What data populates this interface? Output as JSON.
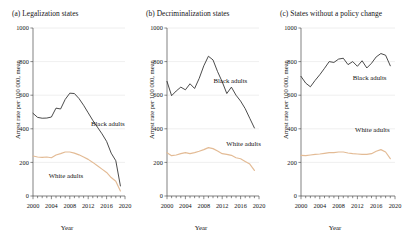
{
  "figure": {
    "xlabel": "Year",
    "ylabel": "Arrest rate per 100 000, mean",
    "colors": {
      "black_adults": "#2b2b2b",
      "white_adults": "#e3bb95",
      "grid": "#e2e2e2",
      "axis": "#4a4a4a"
    }
  },
  "panels": [
    {
      "id": "a",
      "title": "(a) Legalization states"
    },
    {
      "id": "b",
      "title": "(b) Decriminalization states"
    },
    {
      "id": "c",
      "title": "(c) States without a policy change"
    }
  ],
  "chart_data": [
    {
      "type": "line",
      "title": "(a) Legalization states",
      "xlabel": "Year",
      "ylabel": "Arrest rate per 100 000, mean",
      "xlim": [
        2000,
        2020
      ],
      "ylim": [
        0,
        1000
      ],
      "yticks": [
        0,
        200,
        400,
        600,
        800,
        1000
      ],
      "xticks": [
        2000,
        2004,
        2008,
        2012,
        2016,
        2020
      ],
      "grid": true,
      "legend_position": "inline-annotation",
      "x": [
        2000,
        2001,
        2002,
        2003,
        2004,
        2005,
        2006,
        2007,
        2008,
        2009,
        2010,
        2011,
        2012,
        2013,
        2014,
        2015,
        2016,
        2017,
        2018,
        2019
      ],
      "series": [
        {
          "name": "Black adults",
          "color": "#2b2b2b",
          "values": [
            492,
            468,
            463,
            464,
            470,
            523,
            518,
            575,
            612,
            610,
            580,
            540,
            495,
            450,
            410,
            370,
            325,
            255,
            210,
            60
          ]
        },
        {
          "name": "White adults",
          "color": "#e3bb95",
          "values": [
            238,
            232,
            230,
            232,
            228,
            244,
            252,
            262,
            262,
            255,
            245,
            232,
            218,
            200,
            180,
            160,
            140,
            110,
            88,
            30
          ]
        }
      ]
    },
    {
      "type": "line",
      "title": "(b) Decriminalization states",
      "xlabel": "Year",
      "ylabel": "Arrest rate per 100 000, mean",
      "xlim": [
        2000,
        2020
      ],
      "ylim": [
        0,
        1000
      ],
      "yticks": [
        0,
        200,
        400,
        600,
        800,
        1000
      ],
      "xticks": [
        2000,
        2004,
        2008,
        2012,
        2016,
        2020
      ],
      "grid": true,
      "legend_position": "inline-annotation",
      "x": [
        2000,
        2001,
        2002,
        2003,
        2004,
        2005,
        2006,
        2007,
        2008,
        2009,
        2010,
        2011,
        2012,
        2013,
        2014,
        2015,
        2016,
        2017,
        2018,
        2019
      ],
      "series": [
        {
          "name": "Black adults",
          "color": "#2b2b2b",
          "values": [
            682,
            597,
            625,
            648,
            632,
            668,
            640,
            700,
            775,
            832,
            810,
            740,
            680,
            610,
            648,
            600,
            565,
            520,
            462,
            405
          ]
        },
        {
          "name": "White adults",
          "color": "#e3bb95",
          "values": [
            258,
            240,
            244,
            252,
            258,
            252,
            258,
            266,
            276,
            288,
            282,
            268,
            252,
            248,
            242,
            228,
            222,
            206,
            190,
            152
          ]
        }
      ]
    },
    {
      "type": "line",
      "title": "(c) States without a policy change",
      "xlabel": "Year",
      "ylabel": "Arrest rate per 100 000, mean",
      "xlim": [
        2000,
        2020
      ],
      "ylim": [
        0,
        1000
      ],
      "yticks": [
        0,
        200,
        400,
        600,
        800,
        1000
      ],
      "xticks": [
        2000,
        2004,
        2008,
        2012,
        2016,
        2020
      ],
      "grid": true,
      "legend_position": "inline-annotation",
      "x": [
        2000,
        2001,
        2002,
        2003,
        2004,
        2005,
        2006,
        2007,
        2008,
        2009,
        2010,
        2011,
        2012,
        2013,
        2014,
        2015,
        2016,
        2017,
        2018,
        2019
      ],
      "series": [
        {
          "name": "Black adults",
          "color": "#2b2b2b",
          "values": [
            712,
            672,
            650,
            688,
            722,
            760,
            800,
            795,
            815,
            820,
            782,
            800,
            772,
            805,
            762,
            790,
            828,
            848,
            838,
            775
          ]
        },
        {
          "name": "White adults",
          "color": "#e3bb95",
          "values": [
            242,
            240,
            244,
            248,
            250,
            254,
            258,
            258,
            262,
            262,
            256,
            252,
            250,
            248,
            248,
            252,
            266,
            276,
            262,
            222
          ]
        }
      ]
    }
  ]
}
